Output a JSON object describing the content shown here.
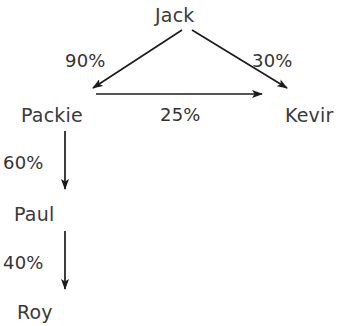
{
  "diagram": {
    "type": "directed-graph",
    "background_color": "#ffffff",
    "stroke_color": "#1c1c1c",
    "text_color": "#3a3a3a",
    "nodes": [
      {
        "id": "jack",
        "label": "Jack"
      },
      {
        "id": "packie",
        "label": "Packie"
      },
      {
        "id": "kevir",
        "label": "Kevir"
      },
      {
        "id": "paul",
        "label": "Paul"
      },
      {
        "id": "roy",
        "label": "Roy"
      }
    ],
    "edges": [
      {
        "from": "jack",
        "to": "packie",
        "label": "90%",
        "direction": "down-left"
      },
      {
        "from": "jack",
        "to": "kevir",
        "label": "30%",
        "direction": "down-right"
      },
      {
        "from": "packie",
        "to": "kevir",
        "label": "25%",
        "direction": "right"
      },
      {
        "from": "packie",
        "to": "paul",
        "label": "60%",
        "direction": "down"
      },
      {
        "from": "paul",
        "to": "roy",
        "label": "40%",
        "direction": "down"
      }
    ]
  }
}
